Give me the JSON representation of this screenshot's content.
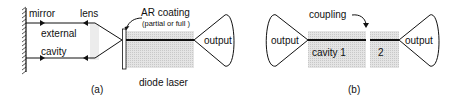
{
  "panel_a": {
    "caption": "(a)",
    "labels": {
      "mirror": "mirror",
      "lens": "lens",
      "external": "external",
      "cavity": "cavity",
      "ar_coating": "AR coating",
      "ar_coating_note": "(partial or full )",
      "output": "output",
      "diode_laser": "diode laser"
    }
  },
  "panel_b": {
    "caption": "(b)",
    "labels": {
      "coupling": "coupling",
      "output_left": "output",
      "cavity_1": "cavity 1",
      "cavity_2": "2",
      "output_right": "output"
    }
  },
  "colors": {
    "stroke": "#111111",
    "cavity_fill": "#dcdcdc",
    "lens_fill": "#ececec"
  }
}
